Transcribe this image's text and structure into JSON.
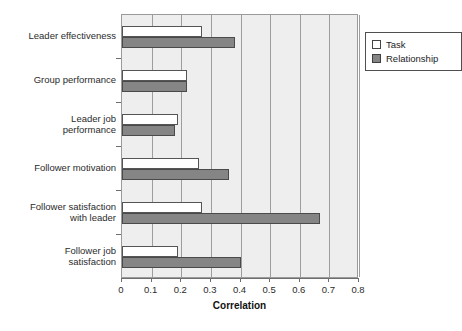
{
  "chart_data": {
    "type": "bar",
    "orientation": "horizontal",
    "title": "",
    "xlabel": "Correlation",
    "ylabel": "",
    "xlim": [
      0,
      0.8
    ],
    "xticks": [
      "0",
      "0.1",
      "0.2",
      "0.3",
      "0.4",
      "0.5",
      "0.6",
      "0.7",
      "0.8"
    ],
    "xtick_values": [
      0,
      0.1,
      0.2,
      0.3,
      0.4,
      0.5,
      0.6,
      0.7,
      0.8
    ],
    "grid": "vertical",
    "legend_position": "top-right",
    "categories": [
      "Leader effectiveness",
      "Group performance",
      "Leader job performance",
      "Follower motivation",
      "Follower satisfaction with leader",
      "Follower job satisfaction"
    ],
    "category_lines": [
      [
        "Leader effectiveness"
      ],
      [
        "Group performance"
      ],
      [
        "Leader job",
        "performance"
      ],
      [
        "Follower motivation"
      ],
      [
        "Follower satisfaction",
        "with leader"
      ],
      [
        "Follower job",
        "satisfaction"
      ]
    ],
    "series": [
      {
        "name": "Task",
        "color": "#ffffff",
        "values": [
          0.27,
          0.22,
          0.19,
          0.26,
          0.27,
          0.19
        ]
      },
      {
        "name": "Relationship",
        "color": "#858585",
        "values": [
          0.38,
          0.22,
          0.18,
          0.36,
          0.67,
          0.4
        ]
      }
    ]
  },
  "legend": {
    "items": [
      {
        "label": "Task",
        "swatch": "task-swatch"
      },
      {
        "label": "Relationship",
        "swatch": "relationship-swatch"
      }
    ]
  },
  "axis": {
    "x_title": "Correlation"
  },
  "colors": {
    "plot_background": "#eeeeee",
    "gridline": "#9d9d9d",
    "frame": "#9a9a9a",
    "task_fill": "#ffffff",
    "relationship_fill": "#858585",
    "text": "#2b2b2b"
  }
}
